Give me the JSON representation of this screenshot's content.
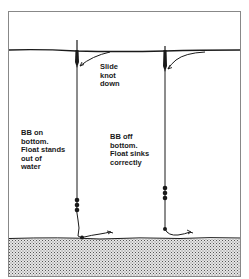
{
  "diagram": {
    "labels": {
      "slide_knot": "Slide\nknot\ndown",
      "left_rig": "BB on\nbottom.\nFloat stands\nout of\nwater",
      "right_rig": "BB off\nbottom.\nFloat sinks\ncorrectly"
    },
    "colors": {
      "ink": "#1a1a1a",
      "frame": "#888888",
      "ground_fill": "#c8c8c8",
      "background": "#ffffff"
    },
    "elements": {
      "water_surface": "water-line",
      "lake_bed": "stippled-ground",
      "rigs": [
        {
          "name": "left-rig",
          "state": "float stands out of water",
          "shot": "BB on bottom"
        },
        {
          "name": "right-rig",
          "state": "float sinks correctly",
          "shot": "BB off bottom"
        }
      ]
    }
  }
}
